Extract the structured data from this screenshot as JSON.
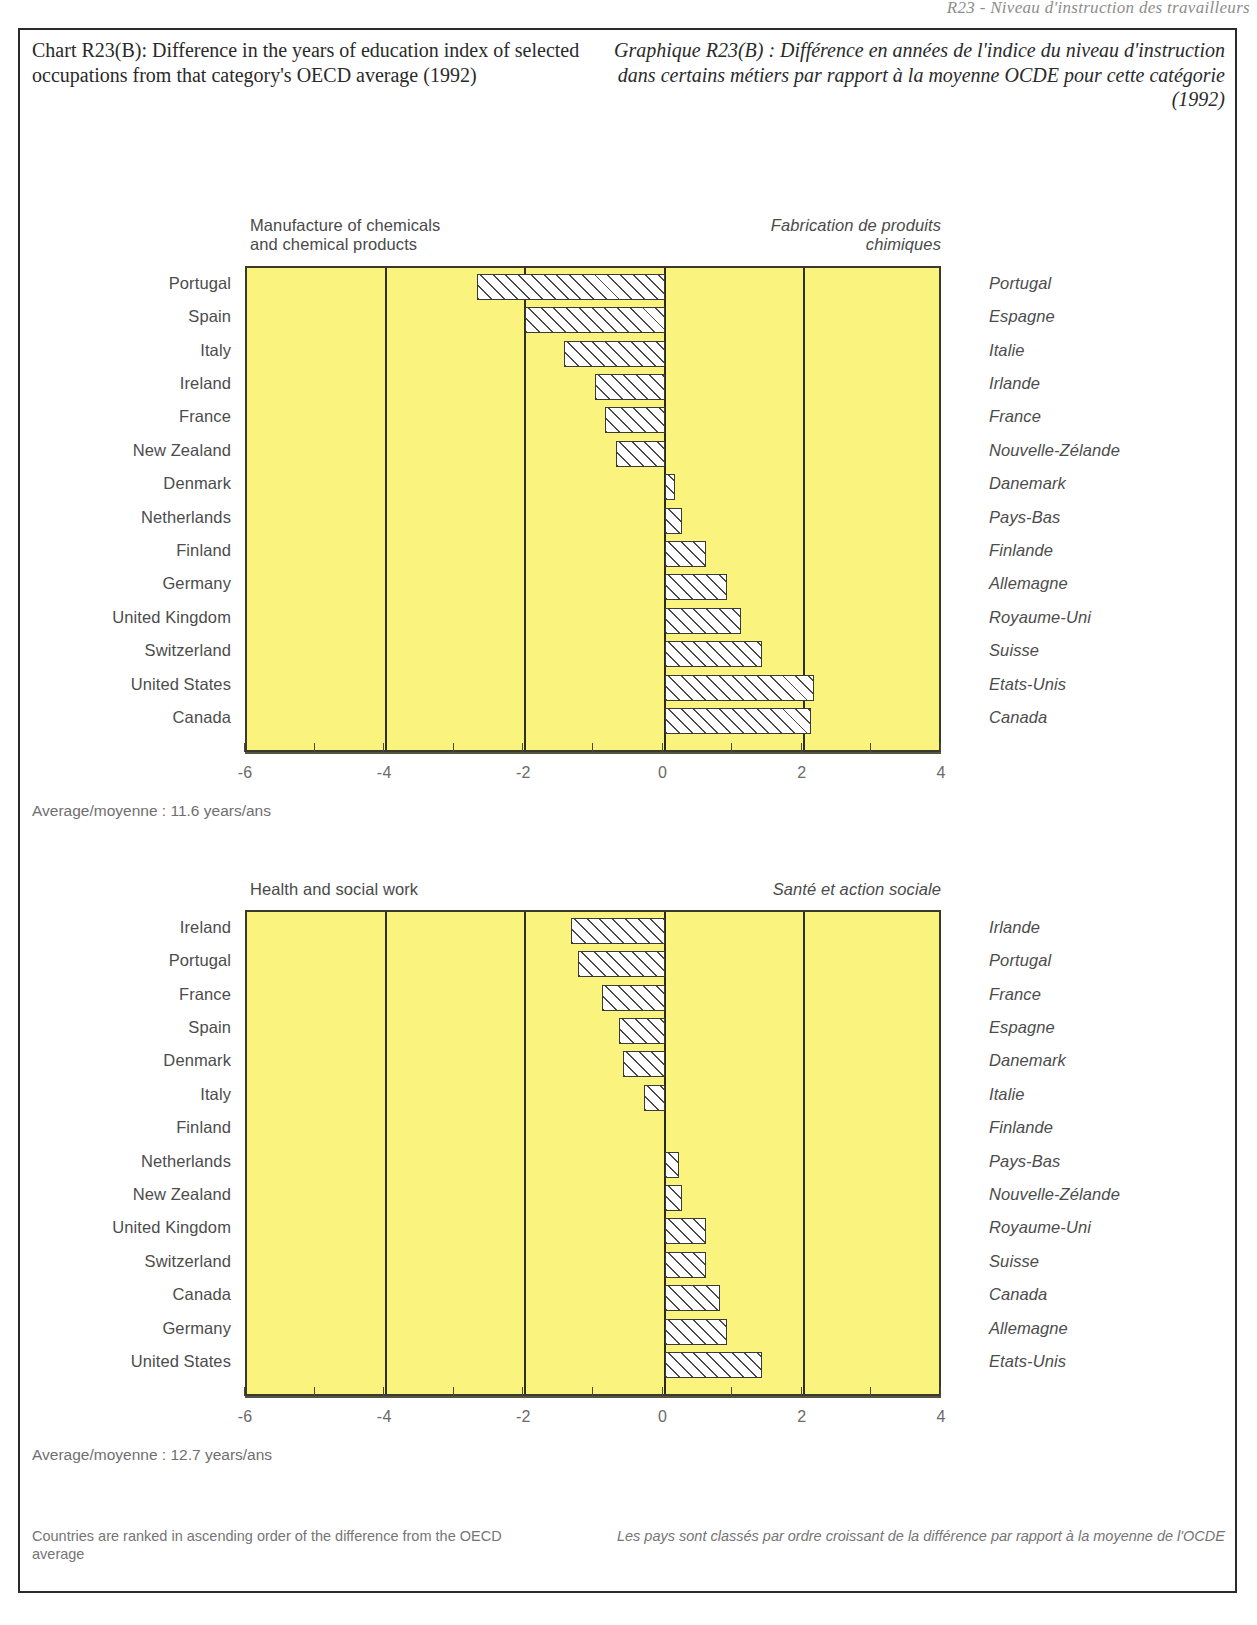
{
  "page": {
    "bleed_header": "R23 - Niveau d'instruction des travailleurs"
  },
  "header": {
    "title_en": "Chart R23(B):\nDifference in the years of education index\nof selected occupations from that\ncategory's OECD average (1992)",
    "title_fr": "Graphique R23(B) :\nDifférence en années de l'indice du niveau\nd'instruction dans certains métiers par rapport\nà la moyenne OCDE pour cette catégorie (1992)"
  },
  "footer": {
    "note_en": "Countries are ranked in ascending order\nof the difference from the OECD average",
    "note_fr": "Les pays sont classés par ordre croissant\nde la différence par rapport à la moyenne de l'OCDE"
  },
  "colors": {
    "plot_background": "#faf37e",
    "bar_fill": "#ffffff",
    "bar_hatch": "#4a4a4a",
    "axis": "#3a3a2a",
    "text": "#4c4c4c"
  },
  "chart_data": [
    {
      "type": "bar",
      "orientation": "horizontal",
      "id": "chemicals",
      "title": "Manufacture of chemicals\nand chemical products",
      "title_fr": "Fabrication de produits\nchimiques",
      "xlabel": "",
      "ylabel": "",
      "xlim": [
        -6,
        4
      ],
      "xticks": [
        -6,
        -4,
        -2,
        0,
        2,
        4
      ],
      "xticklabels": [
        "-6",
        "-4",
        "-2",
        "0",
        "2",
        "4"
      ],
      "minor_tick_step": 1,
      "grid": true,
      "gridlines_at": [
        -4,
        -2,
        0,
        2
      ],
      "legend": "none",
      "average_note": "Average/moyenne : 11.6 years/ans",
      "average_label_en": "Average",
      "average_label_fr": "moyenne",
      "average_value": 11.6,
      "average_unit_en": "years",
      "average_unit_fr": "ans",
      "categories": [
        "Portugal",
        "Spain",
        "Italy",
        "Ireland",
        "France",
        "New Zealand",
        "Denmark",
        "Netherlands",
        "Finland",
        "Germany",
        "United Kingdom",
        "Switzerland",
        "United States",
        "Canada"
      ],
      "categories_fr": [
        "Portugal",
        "Espagne",
        "Italie",
        "Irlande",
        "France",
        "Nouvelle-Zélande",
        "Danemark",
        "Pays-Bas",
        "Finlande",
        "Allemagne",
        "Royaume-Uni",
        "Suisse",
        "Etats-Unis",
        "Canada"
      ],
      "values": [
        -2.7,
        -2.0,
        -1.45,
        -1.0,
        -0.85,
        -0.7,
        0.15,
        0.25,
        0.6,
        0.9,
        1.1,
        1.4,
        2.15,
        2.1
      ]
    },
    {
      "type": "bar",
      "orientation": "horizontal",
      "id": "health",
      "title": "Health and social work",
      "title_fr": "Santé et action sociale",
      "xlabel": "",
      "ylabel": "",
      "xlim": [
        -6,
        4
      ],
      "xticks": [
        -6,
        -4,
        -2,
        0,
        2,
        4
      ],
      "xticklabels": [
        "-6",
        "-4",
        "-2",
        "0",
        "2",
        "4"
      ],
      "minor_tick_step": 1,
      "grid": true,
      "gridlines_at": [
        -4,
        -2,
        0,
        2
      ],
      "legend": "none",
      "average_note": "Average/moyenne : 12.7 years/ans",
      "average_label_en": "Average",
      "average_label_fr": "moyenne",
      "average_value": 12.7,
      "average_unit_en": "years",
      "average_unit_fr": "ans",
      "categories": [
        "Ireland",
        "Portugal",
        "France",
        "Spain",
        "Denmark",
        "Italy",
        "Finland",
        "Netherlands",
        "New Zealand",
        "United Kingdom",
        "Switzerland",
        "Canada",
        "Germany",
        "United States"
      ],
      "categories_fr": [
        "Irlande",
        "Portugal",
        "France",
        "Espagne",
        "Danemark",
        "Italie",
        "Finlande",
        "Pays-Bas",
        "Nouvelle-Zélande",
        "Royaume-Uni",
        "Suisse",
        "Canada",
        "Allemagne",
        "Etats-Unis"
      ],
      "values": [
        -1.35,
        -1.25,
        -0.9,
        -0.65,
        -0.6,
        -0.3,
        0.0,
        0.2,
        0.25,
        0.6,
        0.6,
        0.8,
        0.9,
        1.4
      ]
    }
  ]
}
